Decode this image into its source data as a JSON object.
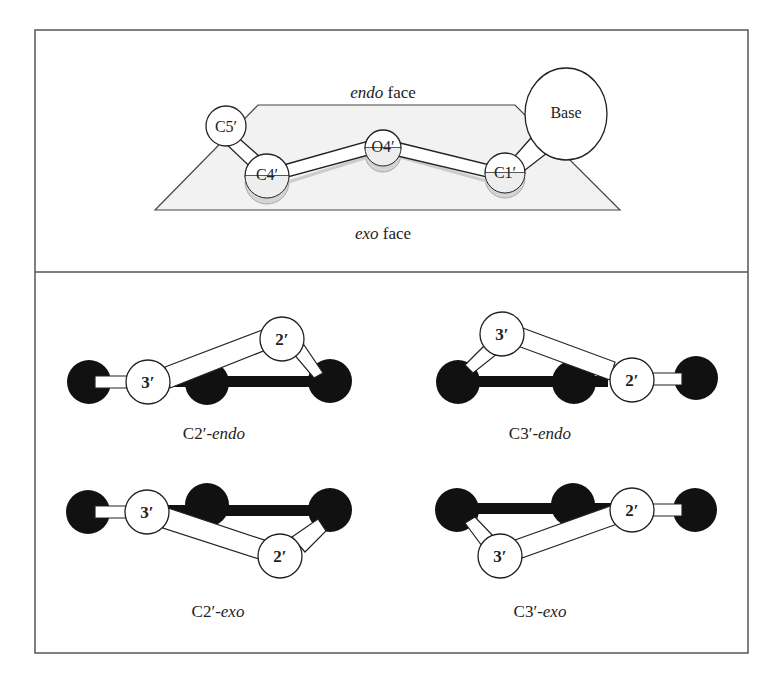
{
  "top_panel": {
    "endo_face_label": {
      "italic": "endo",
      "rest": " face"
    },
    "exo_face_label": {
      "italic": "exo",
      "rest": " face"
    },
    "atoms": {
      "c5": "C5′",
      "c4": "C4′",
      "o4": "O4′",
      "c1": "C1′",
      "base": "Base"
    }
  },
  "bottom_panel": {
    "atom_labels": {
      "three": "3′",
      "two": "2′"
    },
    "conformations": [
      {
        "prefix": "C2′-",
        "suffix": "endo"
      },
      {
        "prefix": "C3′-",
        "suffix": "endo"
      },
      {
        "prefix": "C2′-",
        "suffix": "exo"
      },
      {
        "prefix": "C3′-",
        "suffix": "exo"
      }
    ]
  },
  "colors": {
    "border": "#555555",
    "plane_fill": "#f0f0f0",
    "shadow": "#d4d4d4",
    "black_atom": "#111111"
  }
}
